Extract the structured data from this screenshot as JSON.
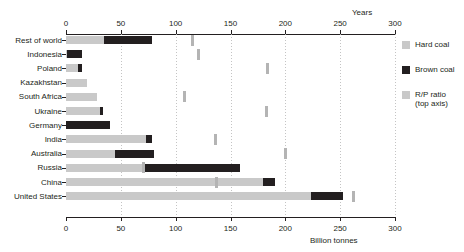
{
  "chart_data": {
    "type": "bar",
    "orientation": "horizontal",
    "title": "",
    "stacked": true,
    "xlabel": "Billion tonnes",
    "xlabel_top": "Years",
    "ylabel": "",
    "xlim": [
      0,
      300
    ],
    "xlim_top": [
      0,
      300
    ],
    "xticks": [
      0,
      50,
      100,
      150,
      200,
      250,
      300
    ],
    "xtick_labels": [
      "0",
      "50",
      "100",
      "150",
      "200",
      "250",
      "300"
    ],
    "xticks_top": [
      0,
      50,
      100,
      150,
      200,
      250,
      300
    ],
    "xtick_labels_top": [
      "0",
      "50",
      "100",
      "150",
      "200",
      "250",
      "300"
    ],
    "grid": true,
    "grid_axis": "x",
    "legend_position": "right",
    "categories": [
      "Rest of world",
      "Indonesia",
      "Poland",
      "Kazakhstan",
      "South Africa",
      "Ukraine",
      "Germany",
      "India",
      "Australia",
      "Russia",
      "China",
      "United States"
    ],
    "series": [
      {
        "name": "Hard coal",
        "color": "#c9c9c9",
        "values": [
          35,
          1,
          11,
          19,
          28,
          31,
          0,
          73,
          45,
          69,
          180,
          223
        ]
      },
      {
        "name": "Brown coal",
        "color": "#231f20",
        "values": [
          43,
          14,
          4,
          0,
          0,
          3,
          40,
          5,
          35,
          90,
          11,
          30
        ]
      },
      {
        "name": "R/P ratio (top axis)",
        "color": "#b4b4b4",
        "marker": "tick",
        "axis": "top",
        "unit": "Years",
        "values": [
          115,
          120,
          183,
          null,
          108,
          182,
          null,
          136,
          200,
          70,
          137,
          262
        ]
      }
    ],
    "colors": {
      "hard_coal": "#c9c9c9",
      "brown_coal": "#231f20",
      "rp_ratio": "#b4b4b4",
      "axis": "#231f20",
      "grid": "#b9b9b9",
      "background": "#ffffff"
    }
  },
  "legend": {
    "items": [
      {
        "label": "Hard coal",
        "sub": ""
      },
      {
        "label": "Brown coal",
        "sub": ""
      },
      {
        "label": "R/P ratio",
        "sub": "(top axis)"
      }
    ]
  }
}
